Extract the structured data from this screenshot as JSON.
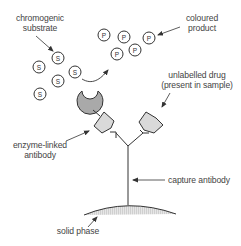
{
  "diagram": {
    "type": "sandwich immunoassay (ELISA) schematic",
    "labels": {
      "chromogenic_substrate": [
        "chromogenic",
        "substrate"
      ],
      "coloured_product": [
        "coloured",
        "product"
      ],
      "unlabelled_drug": [
        "unlabelled drug",
        "(present in sample)"
      ],
      "enzyme_linked_antibody": [
        "enzyme-linked",
        "antibody"
      ],
      "capture_antibody": "capture antibody",
      "solid_phase": "solid phase"
    },
    "substrate_symbol": "S",
    "product_symbol": "P",
    "colors": {
      "line": "#333333",
      "enzyme_fill": "#a9a9a9",
      "drug_fill": "#d9d9d9",
      "solid_phase_fill": "#dcdcdc",
      "text": "#444444"
    }
  }
}
